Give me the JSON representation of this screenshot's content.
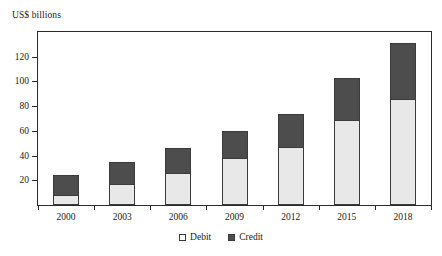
{
  "chart_data": {
    "type": "bar",
    "barmode": "stacked",
    "title": "",
    "subtitle": "",
    "ylabel": "US$ billions",
    "xlabel": "",
    "categories": [
      "2000",
      "2003",
      "2006",
      "2009",
      "2012",
      "2015",
      "2018"
    ],
    "series": [
      {
        "name": "Debit",
        "values": [
          8,
          17,
          26,
          38,
          47,
          69,
          86
        ],
        "color": "#e8e8e8"
      },
      {
        "name": "Credit",
        "values": [
          16,
          18,
          20,
          22,
          27,
          34,
          45
        ],
        "color": "#4d4d4d"
      }
    ],
    "totals": [
      24,
      35,
      46,
      60,
      74,
      103,
      131
    ],
    "ylim": [
      0,
      140
    ],
    "yticks": [
      20,
      40,
      60,
      80,
      100,
      120
    ],
    "ytick_labels": [
      "20",
      "40",
      "60",
      "80",
      "100",
      "120"
    ],
    "grid": false,
    "legend_position": "bottom",
    "legend": [
      "Debit",
      "Credit"
    ]
  },
  "legend": {
    "debit_label": "Debit",
    "credit_label": "Credit"
  }
}
